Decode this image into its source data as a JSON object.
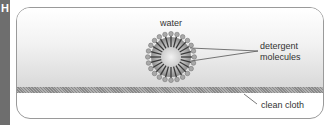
{
  "section_tab": {
    "letter": "H",
    "color": "#6e6e6e"
  },
  "diagram": {
    "title": "",
    "labels": {
      "water": "water",
      "detergent_line1": "detergent",
      "detergent_line2": "molecules",
      "cloth": "clean cloth"
    },
    "colors": {
      "outline": "#9a9a9a",
      "water_top": "#ffffff",
      "water_bottom": "#d9d9d9",
      "cloth": "#8a8a8a",
      "micelle_core": "#bdbdbd",
      "micelle_tail": "#3a3a3a",
      "micelle_head": "#a8a8a8",
      "leader_line": "#555555"
    },
    "micelle": {
      "cx": 171,
      "cy": 57,
      "core_radius": 13,
      "tail_radius": 21,
      "head_radius": 2.3,
      "molecule_count": 24
    }
  }
}
